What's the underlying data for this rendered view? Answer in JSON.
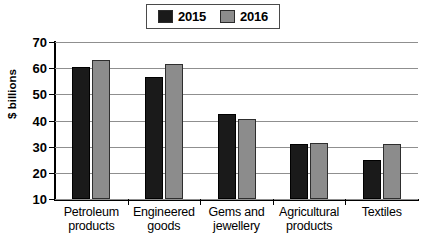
{
  "chart_data": {
    "type": "bar",
    "title": "",
    "subtitle": "",
    "xlabel": "",
    "ylabel": "$ billions",
    "ylim": [
      10,
      70
    ],
    "yticks": [
      10,
      20,
      30,
      40,
      50,
      60,
      70
    ],
    "ytick_labels": [
      "10",
      "20",
      "30",
      "40",
      "50",
      "60",
      "70"
    ],
    "grid": true,
    "legend_position": "top-center",
    "categories": [
      "Petroleum\nproducts",
      "Engineered\ngoods",
      "Gems and\njewellery",
      "Agricultural\nproducts",
      "Textiles"
    ],
    "series": [
      {
        "name": "2015",
        "color": "#1a1a1a",
        "values": [
          60.5,
          56.5,
          42.5,
          31,
          25
        ]
      },
      {
        "name": "2016",
        "color": "#8c8c8c",
        "values": [
          63,
          61.5,
          40.5,
          31.5,
          31
        ]
      }
    ]
  },
  "legend": {
    "entries": [
      {
        "label": "2015",
        "swatch": "legend-swatch-2015"
      },
      {
        "label": "2016",
        "swatch": "legend-swatch-2016"
      }
    ]
  },
  "colors": {
    "series_2015": "#1a1a1a",
    "series_2016": "#8c8c8c",
    "gridline": "#8f8f8f",
    "axis": "#000000",
    "background": "#ffffff"
  }
}
